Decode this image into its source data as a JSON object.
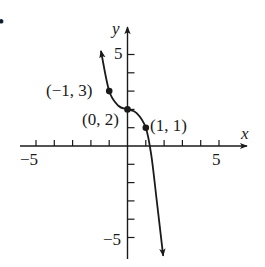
{
  "figure": {
    "bullet": "•",
    "colors": {
      "ink": "#1a1a1a",
      "background": "#ffffff"
    }
  },
  "chart_data": {
    "type": "line",
    "title": "",
    "xlabel": "x",
    "ylabel": "y",
    "xlim": [
      -6,
      6
    ],
    "ylim": [
      -6,
      6
    ],
    "grid": false,
    "x_ticks": [
      -5,
      -4,
      -3,
      -2,
      -1,
      1,
      2,
      3,
      4,
      5
    ],
    "y_ticks": [
      -5,
      -4,
      -3,
      -2,
      -1,
      1,
      2,
      3,
      4,
      5
    ],
    "x_tick_labels": [
      {
        "value": -5,
        "label": "−5"
      },
      {
        "value": 5,
        "label": "5"
      }
    ],
    "y_tick_labels": [
      {
        "value": 5,
        "label": "5"
      },
      {
        "value": -5,
        "label": "−5"
      }
    ],
    "series": [
      {
        "name": "f(x)",
        "description": "Decreasing cubic-like curve with arrows at both ends, flat near (0,2)",
        "x": [
          -1.45,
          -1.0,
          -0.5,
          0,
          0.5,
          1.0,
          1.3,
          1.6,
          1.95
        ],
        "y": [
          5.2,
          3.0,
          2.2,
          2.0,
          1.8,
          1.0,
          -0.5,
          -3.0,
          -6.0
        ],
        "arrow_start": true,
        "arrow_end": true
      }
    ],
    "points": [
      {
        "x": -1,
        "y": 3,
        "label": "(−1, 3)"
      },
      {
        "x": 0,
        "y": 2,
        "label": "(0, 2)"
      },
      {
        "x": 1,
        "y": 1,
        "label": "(1, 1)"
      }
    ]
  }
}
